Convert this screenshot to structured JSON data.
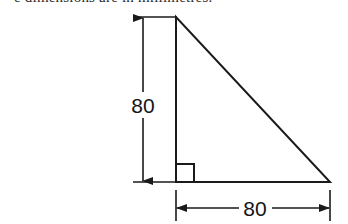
{
  "figure": {
    "caption": "e dimensions are in millimetres.",
    "background_color": "#ffffff",
    "stroke_color": "#1a1a1a",
    "label_color": "#141414",
    "width": 348,
    "height": 224
  },
  "shape": {
    "name": "right-triangle",
    "vertices": {
      "apex": {
        "x": 176,
        "y": 17
      },
      "right_angle": {
        "x": 176,
        "y": 182
      },
      "base_right": {
        "x": 330,
        "y": 182
      }
    },
    "right_angle_marker": {
      "size": 18,
      "label": "right-angle"
    }
  },
  "dimensions": {
    "vertical": {
      "label": "80",
      "unit_note": "millimetres",
      "axis": "vertical",
      "line_x": 143,
      "from_y": 17,
      "to_y": 182,
      "label_x": 143,
      "label_y": 106,
      "extension_top": {
        "x1": 133,
        "x2": 177,
        "y": 17
      },
      "extension_bottom": {
        "x1": 133,
        "x2": 177,
        "y": 182
      }
    },
    "horizontal": {
      "label": "80",
      "unit_note": "millimetres",
      "axis": "horizontal",
      "line_y": 208,
      "from_x": 176,
      "to_x": 330,
      "label_x": 254,
      "label_y": 215,
      "extension_left": {
        "y1": 190,
        "y2": 220,
        "x": 176
      },
      "extension_right": {
        "y1": 190,
        "y2": 220,
        "x": 330
      }
    }
  }
}
